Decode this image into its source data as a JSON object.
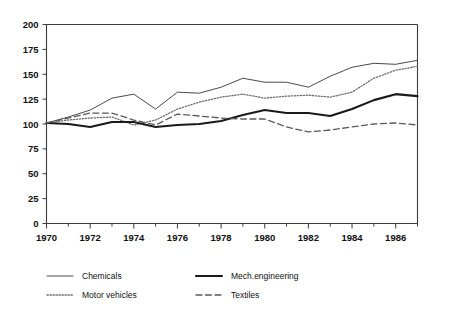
{
  "chart_data": {
    "type": "line",
    "title": "",
    "subtitle": "",
    "xlabel": "",
    "ylabel": "",
    "xlim": [
      1970,
      1987
    ],
    "ylim": [
      0,
      200
    ],
    "grid": false,
    "legend_position": "bottom",
    "x": [
      1970,
      1971,
      1972,
      1973,
      1974,
      1975,
      1976,
      1977,
      1978,
      1979,
      1980,
      1981,
      1982,
      1983,
      1984,
      1985,
      1986,
      1987
    ],
    "y_ticks": [
      0,
      25,
      50,
      75,
      100,
      125,
      150,
      175,
      200
    ],
    "y_tick_labels": [
      "0",
      "25",
      "50",
      "75",
      "100",
      "125",
      "150",
      "175",
      "200"
    ],
    "x_ticks": [
      1970,
      1971,
      1972,
      1973,
      1974,
      1975,
      1976,
      1977,
      1978,
      1979,
      1980,
      1981,
      1982,
      1983,
      1984,
      1985,
      1986,
      1987
    ],
    "x_tick_labels": [
      "1970",
      "",
      "1972",
      "",
      "1974",
      "",
      "1976",
      "",
      "1978",
      "",
      "1980",
      "",
      "1982",
      "",
      "1984",
      "",
      "1986",
      ""
    ],
    "series": [
      {
        "name": "Chemicals",
        "style": "solid-thin",
        "color": "#4a4a4a",
        "values": [
          101,
          107,
          114,
          126,
          130,
          115,
          132,
          131,
          137,
          146,
          142,
          142,
          137,
          148,
          157,
          161,
          160,
          164
        ]
      },
      {
        "name": "Motor vehicles",
        "style": "dotted",
        "color": "#6e6e6e",
        "values": [
          101,
          104,
          106,
          107,
          99,
          104,
          115,
          122,
          127,
          130,
          126,
          128,
          129,
          127,
          132,
          146,
          154,
          158
        ]
      },
      {
        "name": "Mech.engineering",
        "style": "solid-thick",
        "color": "#1a1a1a",
        "values": [
          101,
          100,
          97,
          102,
          102,
          97,
          99,
          100,
          103,
          109,
          114,
          111,
          111,
          108,
          115,
          124,
          130,
          128
        ]
      },
      {
        "name": "Textiles",
        "style": "dashed",
        "color": "#5a5a5a",
        "values": [
          101,
          106,
          111,
          111,
          104,
          99,
          110,
          108,
          106,
          105,
          105,
          97,
          92,
          94,
          97,
          100,
          101,
          99
        ]
      }
    ]
  },
  "legend": {
    "entries": [
      {
        "label": "Chemicals"
      },
      {
        "label": "Mech.engineering"
      },
      {
        "label": "Motor vehicles"
      },
      {
        "label": "Textiles"
      }
    ]
  }
}
